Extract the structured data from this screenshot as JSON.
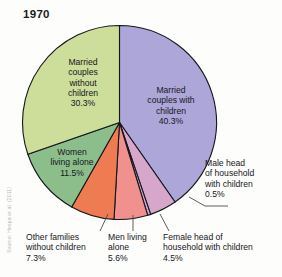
{
  "title": "1970",
  "source_credit": "Source: Hespa et al. (2011)",
  "colors": {
    "married_with_children": "#ADA6D8",
    "female_head_with_children": "#D6A6CB",
    "male_head_with_children": "#CFA9CF",
    "men_living_alone": "#F0918D",
    "other_families_without_children": "#EE7B52",
    "women_living_alone": "#8CBE8C",
    "married_without_children": "#CDDD9A",
    "outline": "#15151c",
    "leader_line": "#4c4c4c",
    "text": "#16161c",
    "background": "#fdfdfb"
  },
  "chart_data": {
    "type": "pie",
    "title": "1970",
    "xlabel": "",
    "ylabel": "",
    "legend_position": "none",
    "grid": false,
    "start_angle_deg": 0,
    "direction": "clockwise",
    "categories": [
      "Married couples with children",
      "Female head of household with children",
      "Male head of household with children",
      "Men living alone",
      "Other families without children",
      "Women living alone",
      "Married couples without children"
    ],
    "values": [
      40.3,
      4.5,
      0.5,
      5.6,
      7.3,
      11.5,
      30.3
    ],
    "units": "percent",
    "slices": [
      {
        "label": "Married couples with children",
        "value": 40.3,
        "value_text": "40.3%",
        "color": "#ADA6D8",
        "label_placement": "inside",
        "label_lines": [
          "Married",
          "couples with",
          "children",
          "40.3%"
        ]
      },
      {
        "label": "Female head of household with children",
        "value": 4.5,
        "value_text": "4.5%",
        "color": "#D6A6CB",
        "label_placement": "outside-below",
        "label_lines": [
          "Female head of",
          "household with children",
          "4.5%"
        ]
      },
      {
        "label": "Male head of household with children",
        "value": 0.5,
        "value_text": "0.5%",
        "color": "#CFA9CF",
        "label_placement": "outside-right",
        "label_lines": [
          "Male head",
          "of household",
          "with children",
          "0.5%"
        ]
      },
      {
        "label": "Men living alone",
        "value": 5.6,
        "value_text": "5.6%",
        "color": "#F0918D",
        "label_placement": "outside-below",
        "label_lines": [
          "Men living",
          "alone",
          "5.6%"
        ]
      },
      {
        "label": "Other families without children",
        "value": 7.3,
        "value_text": "7.3%",
        "color": "#EE7B52",
        "label_placement": "outside-below",
        "label_lines": [
          "Other families",
          "without children",
          "7.3%"
        ]
      },
      {
        "label": "Women living alone",
        "value": 11.5,
        "value_text": "11.5%",
        "color": "#8CBE8C",
        "label_placement": "inside",
        "label_lines": [
          "Women",
          "living alone",
          "11.5%"
        ]
      },
      {
        "label": "Married couples without children",
        "value": 30.3,
        "value_text": "30.3%",
        "color": "#CDDD9A",
        "label_placement": "inside",
        "label_lines": [
          "Married",
          "couples",
          "without",
          "children",
          "30.3%"
        ]
      }
    ]
  },
  "labels": {
    "married_couples_without_children": "Married\ncouples\nwithout\nchildren\n30.3%",
    "married_couples_with_children": "Married\ncouples with\nchildren\n40.3%",
    "women_living_alone": "Women\nliving alone\n11.5%",
    "male_head_of_household": "Male head\nof household\nwith children\n0.5%",
    "other_families_without_children": "Other families\nwithout children\n7.3%",
    "men_living_alone": "Men living\nalone\n5.6%",
    "female_head_of_household": "Female head of\nhousehold with children\n4.5%"
  }
}
